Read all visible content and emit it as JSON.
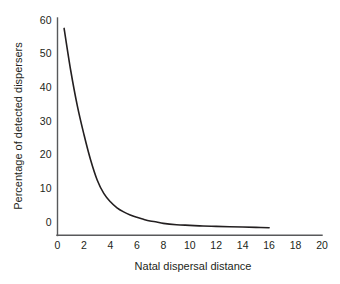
{
  "figure": {
    "background_color": "#ffffff",
    "axis_color": "#58595b",
    "curve_color": "#231f20"
  },
  "chart_data": {
    "type": "line",
    "title": "",
    "xlabel": "Natal dispersal distance",
    "ylabel": "Percentage of detected dispersers",
    "xlim": [
      0,
      20
    ],
    "ylim": [
      -3,
      60
    ],
    "grid": false,
    "legend": false,
    "xticks": [
      0,
      2,
      4,
      6,
      8,
      10,
      12,
      14,
      16,
      18,
      20
    ],
    "xtick_labels": [
      "0",
      "2",
      "4",
      "6",
      "8",
      "10",
      "12",
      "14",
      "16",
      "18",
      "20"
    ],
    "yticks": [
      0,
      10,
      20,
      30,
      40,
      50,
      60
    ],
    "ytick_labels": [
      "0",
      "10",
      "20",
      "30",
      "40",
      "50",
      "60"
    ],
    "series": [
      {
        "name": "Detected dispersers",
        "x": [
          0.5,
          1.0,
          1.5,
          2.0,
          2.5,
          3.0,
          3.5,
          4.0,
          4.5,
          5.0,
          5.5,
          6.0,
          6.5,
          7.0,
          7.5,
          8.0,
          9.0,
          10.0,
          11.0,
          12.0,
          13.0,
          14.0,
          15.0,
          16.0
        ],
        "y": [
          57.5,
          45.0,
          34.5,
          26.0,
          18.5,
          12.5,
          8.5,
          6.0,
          4.2,
          3.0,
          2.1,
          1.4,
          0.8,
          0.3,
          0.0,
          -0.4,
          -0.8,
          -1.0,
          -1.2,
          -1.3,
          -1.4,
          -1.5,
          -1.6,
          -1.7
        ]
      }
    ]
  }
}
